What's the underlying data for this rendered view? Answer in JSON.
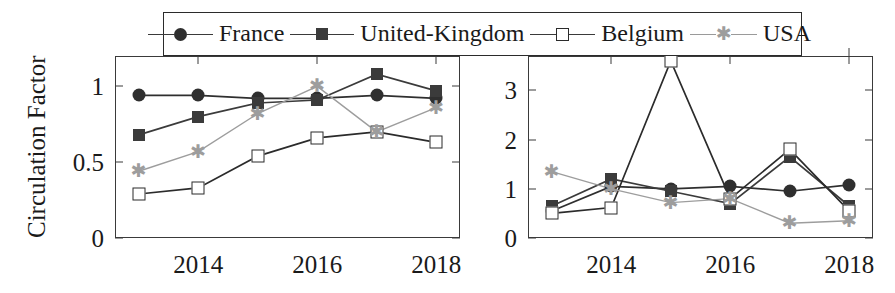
{
  "legend": {
    "items": [
      {
        "label": "France",
        "marker": "filled-circle",
        "color": "#2f2f2f"
      },
      {
        "label": "United-Kingdom",
        "marker": "filled-square",
        "color": "#3b3b3b"
      },
      {
        "label": "Belgium",
        "marker": "open-square",
        "color": "#2b2b2b"
      },
      {
        "label": "USA",
        "marker": "star-asterisk",
        "color": "#9d9d9d"
      }
    ]
  },
  "left_panel": {
    "ylabel": "Circulation Factor",
    "yticks": [
      "0",
      "0.5",
      "1"
    ],
    "xticks": [
      "2014",
      "2016",
      "2018"
    ]
  },
  "right_panel": {
    "ylabel": "",
    "yticks": [
      "0",
      "1",
      "2",
      "3"
    ],
    "xticks": [
      "2014",
      "2016",
      "2018"
    ]
  },
  "chart_data": [
    {
      "type": "line",
      "title": "",
      "xlabel": "",
      "ylabel": "Circulation Factor",
      "x": [
        2013,
        2014,
        2015,
        2016,
        2017,
        2018
      ],
      "xlim": [
        2012.6,
        2018.4
      ],
      "ylim": [
        0,
        1.2
      ],
      "yticks": [
        0,
        0.5,
        1
      ],
      "xticks": [
        2014,
        2016,
        2018
      ],
      "grid": false,
      "legend_position": "top-center-outside",
      "series": [
        {
          "name": "France",
          "marker": "filled-circle",
          "color": "#2f2f2f",
          "values": [
            0.94,
            0.94,
            0.92,
            0.92,
            0.94,
            0.92
          ]
        },
        {
          "name": "United-Kingdom",
          "marker": "filled-square",
          "color": "#3b3b3b",
          "values": [
            0.68,
            0.8,
            0.89,
            0.91,
            1.08,
            0.97
          ]
        },
        {
          "name": "Belgium",
          "marker": "open-square",
          "color": "#2b2b2b",
          "values": [
            0.29,
            0.33,
            0.54,
            0.66,
            0.7,
            0.63
          ]
        },
        {
          "name": "USA",
          "marker": "star-asterisk",
          "color": "#9d9d9d",
          "values": [
            0.44,
            0.57,
            0.82,
            1.0,
            0.7,
            0.86
          ]
        }
      ]
    },
    {
      "type": "line",
      "title": "",
      "xlabel": "",
      "ylabel": "",
      "x": [
        2013,
        2014,
        2015,
        2016,
        2017,
        2018
      ],
      "xlim": [
        2012.6,
        2018.4
      ],
      "ylim": [
        0,
        3.7
      ],
      "yticks": [
        0,
        1,
        2,
        3
      ],
      "xticks": [
        2014,
        2016,
        2018
      ],
      "grid": false,
      "legend_position": "top-center-outside",
      "series": [
        {
          "name": "France",
          "marker": "filled-circle",
          "color": "#2f2f2f",
          "values": [
            0.55,
            1.05,
            1.0,
            1.05,
            0.95,
            1.08
          ]
        },
        {
          "name": "United-Kingdom",
          "marker": "filled-square",
          "color": "#3b3b3b",
          "values": [
            0.65,
            1.2,
            0.95,
            0.7,
            1.65,
            0.65
          ]
        },
        {
          "name": "Belgium",
          "marker": "open-square",
          "color": "#2b2b2b",
          "values": [
            0.5,
            0.62,
            3.6,
            0.8,
            1.8,
            0.55
          ]
        },
        {
          "name": "USA",
          "marker": "star-asterisk",
          "color": "#9d9d9d",
          "values": [
            1.35,
            1.0,
            0.72,
            0.8,
            0.3,
            0.35
          ]
        }
      ]
    }
  ]
}
